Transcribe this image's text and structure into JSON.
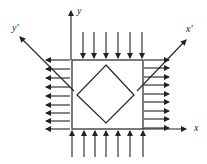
{
  "diagram": {
    "colors": {
      "stroke": "#222222",
      "background": "#ffffff"
    },
    "labels": {
      "y_axis": "y",
      "x_axis": "x",
      "y_prime_axis": "y'",
      "x_prime_axis": "x'"
    },
    "square": {
      "x1": 72,
      "y1": 60,
      "x2": 143,
      "y2": 129
    },
    "diamond": {
      "top": [
        106,
        65
      ],
      "right": [
        134,
        95
      ],
      "bottom": [
        106,
        123
      ],
      "left": [
        77,
        95
      ]
    },
    "axes": {
      "y": {
        "x": 71,
        "from_y": 60,
        "to_y": 11
      },
      "x": {
        "y": 129,
        "from_x": 143,
        "to_x": 186
      },
      "y_prime": {
        "from": [
          74,
          91
        ],
        "to": [
          20,
          37
        ]
      },
      "x_prime": {
        "from": [
          137,
          91
        ],
        "to": [
          186,
          40
        ]
      }
    },
    "top_arrows": {
      "xs": [
        83,
        94,
        106,
        118,
        130,
        142
      ],
      "from_y": 32,
      "to_y": 58,
      "direction": "down"
    },
    "bottom_arrows": {
      "xs": [
        72,
        84,
        95,
        106,
        118,
        130,
        143
      ],
      "from_y": 157,
      "to_y": 131,
      "direction": "up"
    },
    "left_arrows": {
      "ys": [
        60,
        69,
        78,
        87,
        96,
        105,
        113,
        121,
        129
      ],
      "from_x": 70,
      "to_x": 46,
      "direction": "left"
    },
    "right_arrows": {
      "ys": [
        60,
        68,
        77,
        85,
        94,
        102,
        111,
        119,
        128
      ],
      "from_x": 144,
      "to_x": 169,
      "direction": "right"
    }
  }
}
